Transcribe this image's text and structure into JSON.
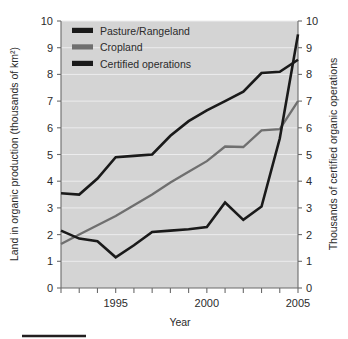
{
  "chart_data": {
    "type": "line",
    "title": "",
    "xlabel": "Year",
    "ylabel": "Land in organic production (thousands of km²)",
    "y2label": "Thousands of certified organic operations",
    "xlim": [
      1992,
      2005
    ],
    "ylim": [
      0,
      10
    ],
    "y2lim": [
      0,
      10
    ],
    "grid": true,
    "legend_position": "top-left",
    "x": [
      1992,
      1993,
      1994,
      1995,
      1996,
      1997,
      1998,
      1999,
      2000,
      2001,
      2002,
      2003,
      2004,
      2005
    ],
    "xticks": [
      1995,
      2000,
      2005
    ],
    "xtick_labels": [
      "1995",
      "2000",
      "2005"
    ],
    "yticks": [
      0,
      1,
      2,
      3,
      4,
      5,
      6,
      7,
      8,
      9,
      10
    ],
    "ytick_labels": [
      "0",
      "1",
      "2",
      "3",
      "4",
      "5",
      "6",
      "7",
      "8",
      "9",
      "10"
    ],
    "y2ticks": [
      0,
      1,
      2,
      3,
      4,
      5,
      6,
      7,
      8,
      9,
      10
    ],
    "y2tick_labels": [
      "0",
      "1",
      "2",
      "3",
      "4",
      "5",
      "6",
      "7",
      "8",
      "9",
      "10"
    ],
    "series": [
      {
        "name": "Pasture/Rangeland",
        "color": "#1a1a1a",
        "axis": "left",
        "width": 2.6,
        "values": [
          3.55,
          3.5,
          4.1,
          4.9,
          4.95,
          5.0,
          5.7,
          6.25,
          6.65,
          7.0,
          7.35,
          8.05,
          8.1,
          8.55
        ]
      },
      {
        "name": "Cropland",
        "color": "#6f6f6f",
        "axis": "left",
        "width": 2.3,
        "values": [
          1.65,
          2.0,
          2.35,
          2.7,
          3.1,
          3.5,
          3.95,
          4.35,
          4.75,
          5.3,
          5.28,
          5.9,
          5.95,
          7.0
        ]
      },
      {
        "name": "Certified operations",
        "color": "#1a1a1a",
        "axis": "right",
        "width": 2.6,
        "values": [
          2.15,
          1.85,
          1.75,
          1.15,
          1.6,
          2.1,
          2.15,
          2.2,
          2.28,
          3.2,
          2.55,
          3.05,
          5.6,
          9.5
        ]
      }
    ]
  },
  "legend": {
    "items": [
      {
        "label": "Pasture/Rangeland",
        "color": "#1a1a1a"
      },
      {
        "label": "Cropland",
        "color": "#6f6f6f"
      },
      {
        "label": "Certified operations",
        "color": "#1a1a1a"
      }
    ]
  },
  "axes": {
    "x_title": "Year",
    "y_left_title": "Land in organic production (thousands of km²)",
    "y_right_title": "Thousands of certified organic operations"
  },
  "colors": {
    "plot_background": "#d4d4d4",
    "gridline": "#ececed",
    "axis": "#6b6b6b",
    "text": "#2b2b2b",
    "pasture": "#1a1a1a",
    "cropland": "#6f6f6f",
    "certified": "#1a1a1a"
  }
}
